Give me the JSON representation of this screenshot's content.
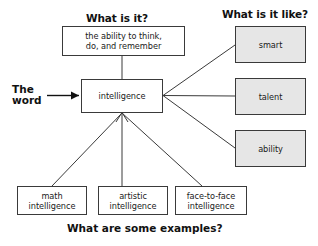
{
  "diagram": {
    "title_top_left": "What is it?",
    "title_top_right": "What is it like?",
    "caption_bottom": "What are some examples?",
    "word_label": "The\nword",
    "center_node": "intelligence",
    "definition_node": "the ability to think,\ndo, and remember",
    "attributes": [
      {
        "label": "smart"
      },
      {
        "label": "talent"
      },
      {
        "label": "ability"
      }
    ],
    "examples": [
      {
        "label": "math\nintelligence"
      },
      {
        "label": "artistic\nintelligence"
      },
      {
        "label": "face-to-face\nintelligence"
      }
    ],
    "colors": {
      "line": "#3a3a3a",
      "node_border": "#3a3a3a",
      "node_fill": "#ffffff",
      "node_fill_shaded": "#e6e6e6",
      "text": "#111111",
      "background": "#ffffff"
    }
  }
}
